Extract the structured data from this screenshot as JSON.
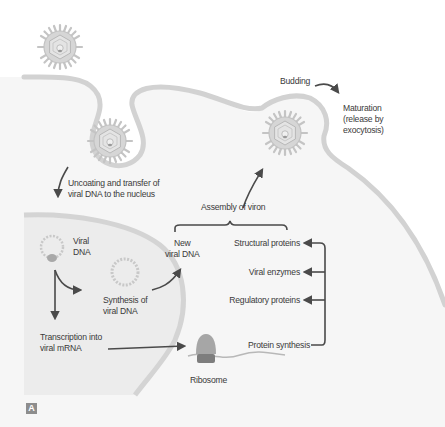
{
  "diagram": {
    "panel_label": "A",
    "colors": {
      "background": "#ffffff",
      "cytoplasm": "#f6f6f6",
      "nucleus": "#ececec",
      "membrane": "#d2d2d2",
      "virus": "#c9c9c9",
      "arrow": "#4a4a4a",
      "text": "#3a3a3a"
    },
    "labels": {
      "budding": "Budding",
      "maturation_1": "Maturation",
      "maturation_2": "(release by",
      "maturation_3": "exocytosis)",
      "uncoating_1": "Uncoating and transfer of",
      "uncoating_2": "viral DNA to the nucleus",
      "assembly": "Assembly of viron",
      "viral_dna_1": "Viral",
      "viral_dna_2": "DNA",
      "new_dna_1": "New",
      "new_dna_2": "viral DNA",
      "synthesis_1": "Synthesis of",
      "synthesis_2": "viral DNA",
      "transcription_1": "Transcription into",
      "transcription_2": "viral mRNA",
      "structural": "Structural proteins",
      "enzymes": "Viral enzymes",
      "regulatory": "Regulatory proteins",
      "protein_synthesis": "Protein synthesis",
      "ribosome": "Ribosome"
    }
  }
}
